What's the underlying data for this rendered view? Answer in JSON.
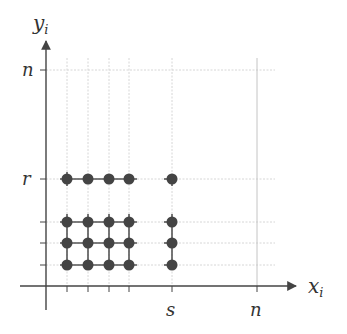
{
  "diagram": {
    "axes": {
      "x_label": "x",
      "x_subscript": "i",
      "y_label": "y",
      "y_subscript": "i"
    },
    "x_tick_labels": {
      "s": "s",
      "n": "n"
    },
    "y_tick_labels": {
      "r": "r",
      "n": "n"
    },
    "grid_columns": [
      "col1",
      "col2",
      "col3",
      "col4",
      "s",
      "n"
    ],
    "grid_rows": [
      "row1",
      "row2",
      "row3",
      "r",
      "n"
    ],
    "points": [
      {
        "col": 1,
        "row": 1
      },
      {
        "col": 2,
        "row": 1
      },
      {
        "col": 3,
        "row": 1
      },
      {
        "col": 4,
        "row": 1
      },
      {
        "col": "s",
        "row": 1
      },
      {
        "col": 1,
        "row": 2
      },
      {
        "col": 2,
        "row": 2
      },
      {
        "col": 3,
        "row": 2
      },
      {
        "col": 4,
        "row": 2
      },
      {
        "col": "s",
        "row": 2
      },
      {
        "col": 1,
        "row": 3
      },
      {
        "col": 2,
        "row": 3
      },
      {
        "col": 3,
        "row": 3
      },
      {
        "col": 4,
        "row": 3
      },
      {
        "col": "s",
        "row": 3
      },
      {
        "col": 1,
        "row": "r"
      },
      {
        "col": 2,
        "row": "r"
      },
      {
        "col": 3,
        "row": "r"
      },
      {
        "col": 4,
        "row": "r"
      },
      {
        "col": "s",
        "row": "r"
      }
    ],
    "colors": {
      "axis": "#444444",
      "grid": "#d6d6d6",
      "point": "#444444",
      "edge": "#555555"
    }
  }
}
